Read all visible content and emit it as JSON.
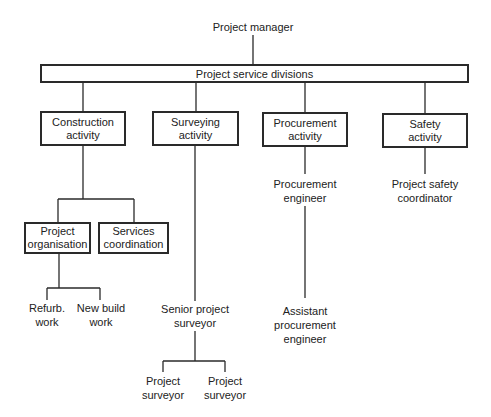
{
  "diagram": {
    "type": "organisation-chart",
    "root": {
      "label": "Project manager"
    },
    "divisions_bar": {
      "label": "Project service divisions"
    },
    "activities": [
      {
        "label_line1": "Construction",
        "label_line2": "activity"
      },
      {
        "label_line1": "Surveying",
        "label_line2": "activity"
      },
      {
        "label_line1": "Procurement",
        "label_line2": "activity"
      },
      {
        "label_line1": "Safety",
        "label_line2": "activity"
      }
    ],
    "construction_children": [
      {
        "label_line1": "Project",
        "label_line2": "organisation"
      },
      {
        "label_line1": "Services",
        "label_line2": "coordination"
      }
    ],
    "organisation_children": [
      {
        "label_line1": "Refurb.",
        "label_line2": "work"
      },
      {
        "label_line1": "New build",
        "label_line2": "work"
      }
    ],
    "surveying_chain": {
      "senior": {
        "label_line1": "Senior project",
        "label_line2": "surveyor"
      },
      "children": [
        {
          "label_line1": "Project",
          "label_line2": "surveyor"
        },
        {
          "label_line1": "Project",
          "label_line2": "surveyor"
        }
      ]
    },
    "procurement_chain": {
      "engineer": {
        "label_line1": "Procurement",
        "label_line2": "engineer"
      },
      "assistant": {
        "label_line1": "Assistant",
        "label_line2": "procurement",
        "label_line3": "engineer"
      }
    },
    "safety_chain": {
      "coordinator": {
        "label_line1": "Project safety",
        "label_line2": "coordinator"
      }
    },
    "colors": {
      "line": "#2a2a2a",
      "background": "#ffffff",
      "text": "#222222"
    }
  }
}
